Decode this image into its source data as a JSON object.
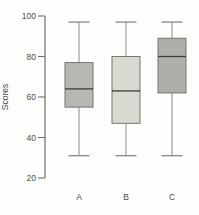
{
  "chart_data": {
    "type": "boxplot",
    "title": "",
    "xlabel": "",
    "ylabel": "Scores",
    "ylim": [
      20,
      100
    ],
    "yticks": [
      100,
      80,
      60,
      40,
      20
    ],
    "grid": false,
    "legend": false,
    "categories": [
      "A",
      "B",
      "C"
    ],
    "series": [
      {
        "name": "A",
        "min": 31,
        "q1": 55,
        "median": 64,
        "q3": 77,
        "max": 97,
        "fill": "#b6b9b2"
      },
      {
        "name": "B",
        "min": 31,
        "q1": 47,
        "median": 63,
        "q3": 80,
        "max": 97,
        "fill": "#d8dad2"
      },
      {
        "name": "C",
        "min": 31,
        "q1": 62,
        "median": 80,
        "q3": 89,
        "max": 97,
        "fill": "#adb0aa"
      }
    ],
    "colors": {
      "axis": "#6f726d",
      "tick_text": "#4a4d48",
      "box_border": "#74776f",
      "median_line": "#3a3d38",
      "whisker": "#8b8e87",
      "whisker_cap": "#7c7f78",
      "background": "#fdfdfc"
    }
  }
}
